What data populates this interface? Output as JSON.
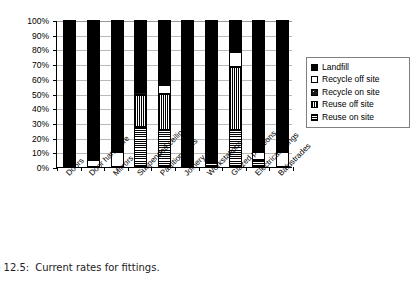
{
  "figure": {
    "caption_prefix": "ure 12.5:",
    "caption_text": "Current rates for fittings."
  },
  "chart_data": {
    "type": "bar",
    "stacked": true,
    "title": "",
    "xlabel": "",
    "ylabel": "",
    "ylim": [
      0,
      100
    ],
    "yunit": "%",
    "grid": true,
    "legend_position": "right",
    "ytick_labels": [
      "100%",
      "90%",
      "80%",
      "70%",
      "60%",
      "50%",
      "40%",
      "30%",
      "20%",
      "10%",
      "0%"
    ],
    "ytick_values": [
      100,
      90,
      80,
      70,
      60,
      50,
      40,
      30,
      20,
      10,
      0
    ],
    "categories": [
      "Doors",
      "Door hardware",
      "Mirrors",
      "Suspended ceilings",
      "Partition walls",
      "Joinery",
      "Workstations",
      "Glazed partitions",
      "Electrical fittings",
      "Balustrades"
    ],
    "series": [
      {
        "name": "Reuse on site",
        "key": "reuse-on",
        "color": "#ffffff",
        "pattern": "fine-cross-hatch",
        "values": [
          0,
          0,
          0,
          27,
          25,
          0,
          3,
          25,
          5,
          0
        ]
      },
      {
        "name": "Reuse off site",
        "key": "reuse-off",
        "color": "#ffffff",
        "pattern": "vertical-lines",
        "values": [
          0,
          0,
          0,
          22,
          25,
          0,
          0,
          43,
          0,
          0
        ]
      },
      {
        "name": "Recycle on site",
        "key": "recycle-on",
        "color": "#1a1a1a",
        "pattern": "dark-speckle",
        "values": [
          0,
          0,
          0,
          2,
          0,
          0,
          0,
          0,
          0,
          0
        ]
      },
      {
        "name": "Recycle off site",
        "key": "recycle-off",
        "color": "#ffffff",
        "pattern": "sparse-dots",
        "values": [
          0,
          5,
          10,
          0,
          6,
          0,
          0,
          10,
          5,
          10
        ]
      },
      {
        "name": "Landfill",
        "key": "landfill",
        "color": "#000000",
        "pattern": "solid",
        "values": [
          100,
          95,
          90,
          49,
          44,
          100,
          97,
          22,
          90,
          90
        ]
      }
    ],
    "legend_entries": [
      {
        "label": "Landfill",
        "key": "landfill"
      },
      {
        "label": "Recycle off site",
        "key": "recycle-off"
      },
      {
        "label": "Recycle on site",
        "key": "recycle-on"
      },
      {
        "label": "Reuse off site",
        "key": "reuse-off"
      },
      {
        "label": "Reuse on site",
        "key": "reuse-on"
      }
    ]
  }
}
